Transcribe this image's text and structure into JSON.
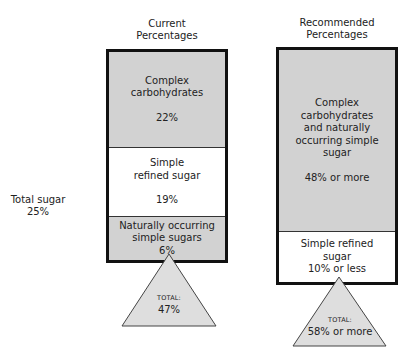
{
  "side_label": {
    "line1": "Total sugar",
    "line2": "25%"
  },
  "current": {
    "title_line1": "Current",
    "title_line2": "Percentages",
    "segments": [
      {
        "line1": "Complex",
        "line2": "carbohydrates",
        "value": "22%"
      },
      {
        "line1": "Simple",
        "line2": "refined sugar",
        "value": "19%"
      },
      {
        "line1": "Naturally occurring",
        "line2": "simple sugars",
        "value": "6%"
      }
    ],
    "total_label": "TOTAL:",
    "total_value": "47%"
  },
  "recommended": {
    "title_line1": "Recommended",
    "title_line2": "Percentages",
    "segments": [
      {
        "line1": "Complex",
        "line2": "carbohydrates",
        "line3": "and naturally",
        "line4": "occurring simple",
        "line5": "sugar",
        "value": "48% or more"
      },
      {
        "line1": "Simple refined",
        "line2": "sugar",
        "value": "10% or less"
      }
    ],
    "total_label": "TOTAL:",
    "total_value": "58% or more"
  },
  "colors": {
    "segment_gray": "#d2d2d2",
    "triangle_fill": "#dedede",
    "border": "#111111"
  }
}
